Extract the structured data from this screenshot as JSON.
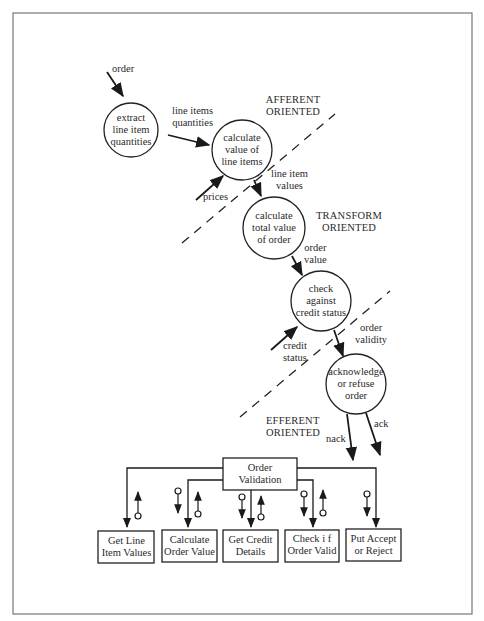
{
  "diagram": {
    "type": "structured-design transform analysis (DFD to structure chart)",
    "regions": {
      "afferent": "AFFERENT ORIENTED",
      "transform": "TRANSFORM ORIENTED",
      "efferent": "EFFERENT ORIENTED"
    },
    "processes": [
      {
        "id": "p1",
        "lines": [
          "extract",
          "line item",
          "quantities"
        ]
      },
      {
        "id": "p2",
        "lines": [
          "calculate",
          "value of",
          "line items"
        ]
      },
      {
        "id": "p3",
        "lines": [
          "calculate",
          "total value",
          "of order"
        ]
      },
      {
        "id": "p4",
        "lines": [
          "check",
          "against",
          "credit status"
        ]
      },
      {
        "id": "p5",
        "lines": [
          "acknowledge",
          "or refuse",
          "order"
        ]
      }
    ],
    "flows": [
      {
        "label_lines": [
          "order"
        ],
        "to": "p1"
      },
      {
        "label_lines": [
          "line items",
          "quantities"
        ],
        "from": "p1",
        "to": "p2"
      },
      {
        "label_lines": [
          "prices"
        ],
        "to": "p2"
      },
      {
        "label_lines": [
          "line item",
          "values"
        ],
        "from": "p2",
        "to": "p3"
      },
      {
        "label_lines": [
          "order",
          "value"
        ],
        "from": "p3",
        "to": "p4"
      },
      {
        "label_lines": [
          "credit",
          "status"
        ],
        "to": "p4"
      },
      {
        "label_lines": [
          "order",
          "validity"
        ],
        "from": "p4",
        "to": "p5"
      },
      {
        "label_lines": [
          "nack"
        ],
        "from": "p5"
      },
      {
        "label_lines": [
          "ack"
        ],
        "from": "p5"
      }
    ],
    "structure_chart": {
      "root": {
        "lines": [
          "Order",
          "Validation"
        ]
      },
      "modules": [
        {
          "lines": [
            "Get Line",
            "Item Values"
          ]
        },
        {
          "lines": [
            "Calculate",
            "Order Value"
          ]
        },
        {
          "lines": [
            "Get Credit",
            "Details"
          ]
        },
        {
          "lines": [
            "Check i f",
            "Order Valid"
          ]
        },
        {
          "lines": [
            "Put Accept",
            "or Reject"
          ]
        }
      ]
    }
  }
}
